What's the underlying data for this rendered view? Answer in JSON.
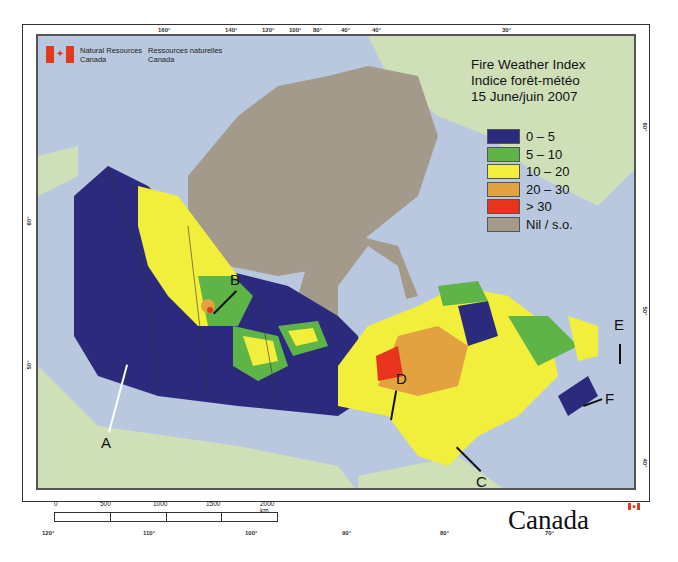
{
  "header": {
    "agency_en_line1": "Natural Resources",
    "agency_en_line2": "Canada",
    "agency_fr_line1": "Ressources naturelles",
    "agency_fr_line2": "Canada"
  },
  "title": {
    "line1": "Fire Weather Index",
    "line2": "Indice forêt-météo",
    "line3": "15 June/juin 2007"
  },
  "legend": {
    "items": [
      {
        "label": "0 – 5",
        "color": "#2b2a7c"
      },
      {
        "label": "5 – 10",
        "color": "#5fb447"
      },
      {
        "label": "10 – 20",
        "color": "#f2ef3c"
      },
      {
        "label": "20 – 30",
        "color": "#e2a240"
      },
      {
        "label": "> 30",
        "color": "#e8341d"
      },
      {
        "label": "Nil / s.o.",
        "color": "#a39a8b"
      }
    ]
  },
  "graticule": {
    "top": [
      "160°",
      "140°",
      "120°",
      "100°",
      "80°",
      "40°",
      "40°",
      "30°"
    ],
    "bottom": [
      "120°",
      "110°",
      "100°",
      "90°",
      "80°",
      "70°"
    ],
    "left": [
      "60°",
      "50°"
    ],
    "right": [
      "60°",
      "50°",
      "40°"
    ]
  },
  "markers": [
    "A",
    "B",
    "C",
    "D",
    "E",
    "F"
  ],
  "scale_bar": {
    "labels": [
      "0",
      "500",
      "1000",
      "1500",
      "2000 km"
    ]
  },
  "wordmark": "Canada",
  "colors": {
    "water": "#b9c8de",
    "foreign_land": "#cfdfb8",
    "nil": "#a39a8b"
  }
}
